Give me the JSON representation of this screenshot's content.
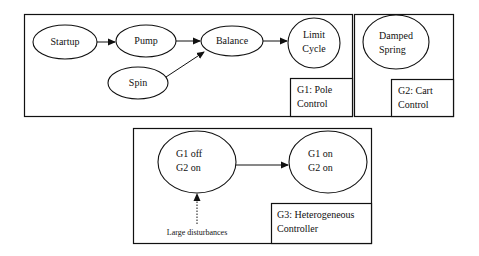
{
  "diagram": {
    "stroke_color": "#111111",
    "background_color": "#ffffff",
    "groups": [
      {
        "id": "G1",
        "label_line1": "G1: Pole",
        "label_line2": "Control",
        "nodes": [
          {
            "id": "startup",
            "label": "Startup"
          },
          {
            "id": "pump",
            "label": "Pump"
          },
          {
            "id": "balance",
            "label": "Balance"
          },
          {
            "id": "limit_cycle",
            "label_line1": "Limit",
            "label_line2": "Cycle"
          },
          {
            "id": "spin",
            "label": "Spin"
          }
        ],
        "edges": [
          {
            "from": "startup",
            "to": "pump"
          },
          {
            "from": "pump",
            "to": "balance"
          },
          {
            "from": "balance",
            "to": "limit_cycle"
          },
          {
            "from": "spin",
            "to": "balance"
          }
        ]
      },
      {
        "id": "G2",
        "label_line1": "G2: Cart",
        "label_line2": "Control",
        "nodes": [
          {
            "id": "damped_spring",
            "label_line1": "Damped",
            "label_line2": "Spring"
          }
        ]
      },
      {
        "id": "G3",
        "label_line1": "G3: Heterogeneous",
        "label_line2": "Controller",
        "nodes": [
          {
            "id": "g1off_g2on",
            "label_line1": "G1 off",
            "label_line2": "G2 on"
          },
          {
            "id": "g1on_g2on",
            "label_line1": "G1 on",
            "label_line2": "G2 on"
          }
        ],
        "edges": [
          {
            "from": "g1off_g2on",
            "to": "g1on_g2on",
            "style": "solid"
          }
        ],
        "external_input": {
          "label": "Large disturbances",
          "target": "g1off_g2on",
          "style": "dashed"
        }
      }
    ]
  }
}
